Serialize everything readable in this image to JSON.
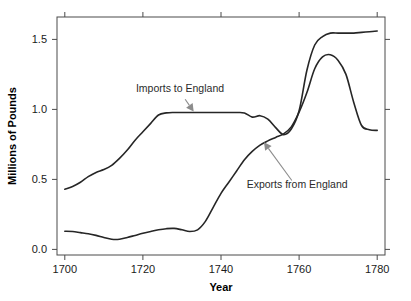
{
  "chart_data": {
    "type": "line",
    "title": "",
    "xlabel": "Year",
    "ylabel": "Millions of Pounds",
    "xlim": [
      1698,
      1782
    ],
    "ylim": [
      -0.04,
      1.66
    ],
    "grid": false,
    "legend": "none (inline annotations)",
    "xticks": [
      1700,
      1720,
      1740,
      1760,
      1780
    ],
    "xtick_labels": [
      "1700",
      "1720",
      "1740",
      "1760",
      "1780"
    ],
    "yticks": [
      0.0,
      0.5,
      1.0,
      1.5
    ],
    "ytick_labels": [
      "0.0",
      "0.5",
      "1.0",
      "1.5"
    ],
    "line_color": "#262626",
    "annotation_color": "#8c8c8c",
    "axis_color": "#4a4a4a",
    "series": [
      {
        "name": "Imports to England",
        "x": [
          1700,
          1702,
          1704,
          1706,
          1708,
          1710,
          1712,
          1714,
          1716,
          1718,
          1720,
          1722,
          1724,
          1726,
          1728,
          1730,
          1732,
          1734,
          1736,
          1738,
          1740,
          1742,
          1744,
          1746,
          1748,
          1750,
          1752,
          1754,
          1756,
          1758,
          1760,
          1762,
          1764,
          1766,
          1768,
          1770,
          1772,
          1774,
          1776,
          1778,
          1780
        ],
        "values": [
          0.43,
          0.45,
          0.48,
          0.52,
          0.55,
          0.57,
          0.6,
          0.65,
          0.71,
          0.78,
          0.84,
          0.9,
          0.96,
          0.975,
          0.978,
          0.978,
          0.978,
          0.978,
          0.978,
          0.978,
          0.978,
          0.978,
          0.978,
          0.975,
          0.945,
          0.955,
          0.93,
          0.87,
          0.82,
          0.86,
          0.99,
          1.28,
          1.46,
          1.52,
          1.545,
          1.545,
          1.545,
          1.545,
          1.55,
          1.555,
          1.56
        ]
      },
      {
        "name": "Exports from England",
        "x": [
          1700,
          1702,
          1704,
          1706,
          1708,
          1710,
          1712,
          1714,
          1716,
          1718,
          1720,
          1722,
          1724,
          1726,
          1728,
          1730,
          1732,
          1734,
          1736,
          1738,
          1740,
          1742,
          1744,
          1746,
          1748,
          1750,
          1752,
          1754,
          1756,
          1758,
          1760,
          1762,
          1764,
          1766,
          1768,
          1770,
          1772,
          1774,
          1776,
          1778,
          1780
        ],
        "values": [
          0.13,
          0.128,
          0.12,
          0.112,
          0.1,
          0.085,
          0.072,
          0.072,
          0.085,
          0.1,
          0.115,
          0.128,
          0.14,
          0.148,
          0.15,
          0.14,
          0.128,
          0.14,
          0.2,
          0.3,
          0.4,
          0.48,
          0.56,
          0.64,
          0.7,
          0.745,
          0.775,
          0.8,
          0.825,
          0.875,
          0.98,
          1.12,
          1.29,
          1.375,
          1.39,
          1.35,
          1.25,
          1.05,
          0.885,
          0.855,
          0.85
        ]
      }
    ],
    "annotations": [
      {
        "label": "Imports to England",
        "text_x": 1729.5,
        "text_y": 1.125,
        "point_x": 1733.0,
        "point_y": 0.985
      },
      {
        "label": "Exports from England",
        "text_x": 1759.5,
        "text_y": 0.44,
        "point_x": 1751.0,
        "point_y": 0.765
      }
    ]
  }
}
